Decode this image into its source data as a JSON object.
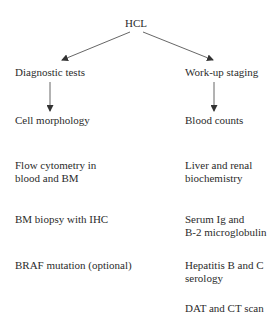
{
  "root": {
    "label": "HCL"
  },
  "branches": [
    {
      "label": "Diagnostic tests",
      "items": [
        {
          "lines": [
            "Cell morphology"
          ]
        },
        {
          "lines": [
            "Flow cytometry in",
            "blood and BM"
          ]
        },
        {
          "lines": [
            "BM biopsy with IHC"
          ]
        },
        {
          "lines": [
            "BRAF mutation (optional)"
          ]
        }
      ]
    },
    {
      "label": "Work-up staging",
      "items": [
        {
          "lines": [
            "Blood counts"
          ]
        },
        {
          "lines": [
            "Liver and renal",
            "biochemistry"
          ]
        },
        {
          "lines": [
            "Serum Ig and",
            "B-2 microglobulin"
          ]
        },
        {
          "lines": [
            "Hepatitis B and C",
            "serology"
          ]
        },
        {
          "lines": [
            "DAT and CT scan"
          ]
        }
      ]
    }
  ],
  "colors": {
    "text": "#2b2b2b",
    "arrow": "#333333",
    "background": "#ffffff"
  }
}
